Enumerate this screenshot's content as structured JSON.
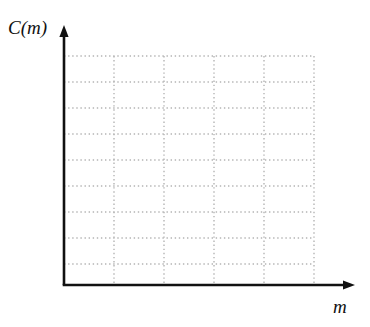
{
  "figure": {
    "title": "",
    "background_color": "#ffffff",
    "width": 370,
    "height": 327
  },
  "axes": {
    "x": {
      "label": "m",
      "label_style": "italic",
      "arrow": true,
      "color": "#111111",
      "origin_px": 64,
      "end_px": 355,
      "baseline_px": 285,
      "tick_labels": [],
      "gridline_count": 5
    },
    "y": {
      "label": "C(m)",
      "label_style": "italic",
      "arrow": true,
      "color": "#111111",
      "origin_px": 285,
      "end_px": 25,
      "baseline_px": 64,
      "tick_labels": [],
      "gridline_count": 9
    }
  },
  "grid": {
    "visible": true,
    "style": "dotted",
    "color": "#b4b4b4",
    "dot_size": 1.4,
    "left_px": 64,
    "right_px": 314,
    "top_px": 56,
    "bottom_px": 285,
    "vertical_lines_px": [
      114,
      164,
      214,
      264,
      314
    ],
    "horizontal_lines_px": [
      56,
      82,
      108,
      134,
      160,
      186,
      212,
      238,
      264
    ],
    "column_spacing_px": 50,
    "row_spacing_px": 26
  },
  "chart_data": {
    "type": "line",
    "title": "",
    "xlabel": "m",
    "ylabel": "C(m)",
    "series": [],
    "x": [],
    "grid": true,
    "legend": "none",
    "note": "Empty coordinate grid - no data plotted"
  },
  "icons": {
    "x_arrow": "arrow-right",
    "y_arrow": "arrow-up"
  }
}
